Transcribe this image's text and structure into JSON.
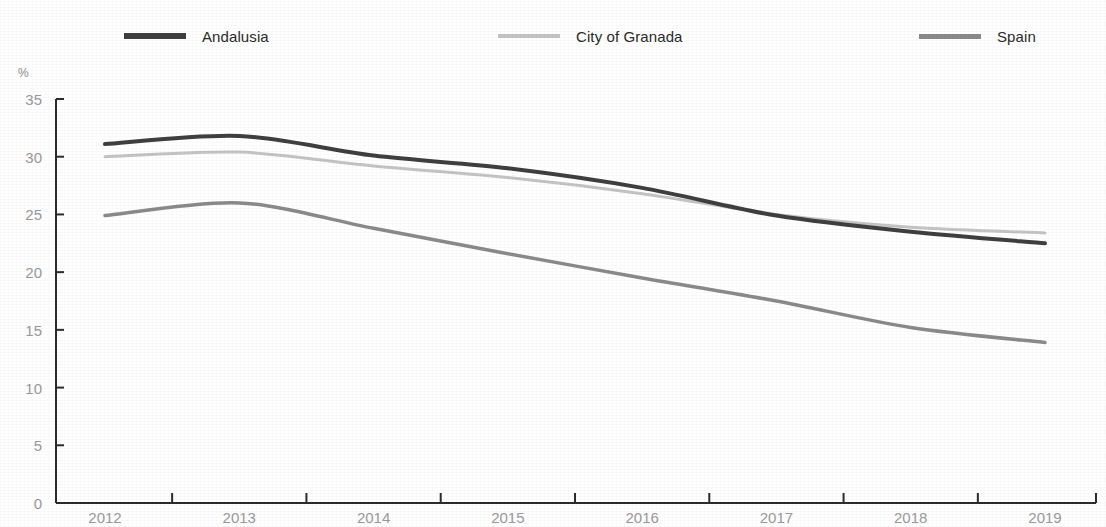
{
  "legend": {
    "position": "top",
    "items": [
      {
        "label": "Andalusia",
        "color": "#3f3f3f"
      },
      {
        "label": "City of Granada",
        "color": "#c4c4c4"
      },
      {
        "label": "Spain",
        "color": "#8a8a8a"
      }
    ]
  },
  "axes": {
    "y_unit": "%",
    "y_ticks": [
      "35",
      "30",
      "25",
      "20",
      "15",
      "10",
      "5",
      "0"
    ],
    "x_ticks": [
      "2012",
      "2013",
      "2014",
      "2015",
      "2016",
      "2017",
      "2018",
      "2019"
    ]
  },
  "chart_data": {
    "type": "line",
    "title": "",
    "subtitle": "",
    "xlabel": "",
    "ylabel": "%",
    "categories": [
      "2012",
      "2013",
      "2014",
      "2015",
      "2016",
      "2017",
      "2018",
      "2019"
    ],
    "x": [
      2012,
      2013,
      2014,
      2015,
      2016,
      2017,
      2018,
      2019
    ],
    "ylim": [
      0,
      35
    ],
    "ytick_step": 5,
    "grid": false,
    "legend_position": "top",
    "series": [
      {
        "name": "Andalusia",
        "color": "#3f3f3f",
        "width": 4,
        "values": [
          31.1,
          31.8,
          30.1,
          29.0,
          27.3,
          24.9,
          23.5,
          22.5
        ]
      },
      {
        "name": "City of Granada",
        "color": "#c4c4c4",
        "width": 3,
        "values": [
          30.0,
          30.4,
          29.2,
          28.2,
          26.8,
          25.0,
          23.9,
          23.4
        ]
      },
      {
        "name": "Spain",
        "color": "#8a8a8a",
        "width": 3.5,
        "values": [
          24.9,
          26.0,
          23.8,
          21.6,
          19.5,
          17.5,
          15.2,
          13.9
        ]
      }
    ]
  }
}
